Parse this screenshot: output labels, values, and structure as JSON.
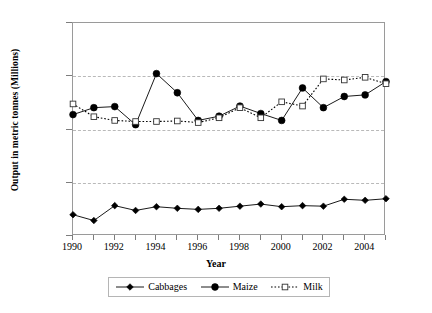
{
  "chart_data": {
    "type": "line",
    "title": "",
    "xlabel": "Year",
    "ylabel": "Output in metric tonnes (Millions)",
    "x": [
      1990,
      1991,
      1992,
      1993,
      1994,
      1995,
      1996,
      1997,
      1998,
      1999,
      2000,
      2001,
      2002,
      2003,
      2004,
      2005
    ],
    "xlim": [
      1990,
      2005
    ],
    "ylim": [
      0.0,
      4.0
    ],
    "ytick_labels": [
      "0.0",
      "1.0",
      "2.0",
      "3.0",
      "4.0"
    ],
    "ytick_values": [
      0.0,
      1.0,
      2.0,
      3.0,
      4.0
    ],
    "xtick_labels": [
      "1990",
      "1992",
      "1994",
      "1996",
      "1998",
      "2000",
      "2002",
      "2004"
    ],
    "xtick_values": [
      1990,
      1992,
      1994,
      1996,
      1998,
      2000,
      2002,
      2004
    ],
    "grid": "horizontal dashed at 1.0, 2.0, 3.0",
    "legend_position": "bottom-center",
    "series": [
      {
        "name": "Cabbages",
        "marker": "filled-diamond",
        "line": "solid",
        "color": "#000000",
        "values": [
          0.4,
          0.29,
          0.57,
          0.48,
          0.55,
          0.52,
          0.5,
          0.52,
          0.56,
          0.6,
          0.55,
          0.57,
          0.56,
          0.69,
          0.67,
          0.7
        ]
      },
      {
        "name": "Maize",
        "marker": "filled-circle",
        "line": "solid",
        "color": "#000000",
        "values": [
          2.28,
          2.41,
          2.43,
          2.09,
          3.05,
          2.69,
          2.17,
          2.25,
          2.44,
          2.3,
          2.17,
          2.78,
          2.41,
          2.62,
          2.65,
          2.9
        ]
      },
      {
        "name": "Milk",
        "marker": "open-square",
        "line": "dotted",
        "color": "#000000",
        "values": [
          2.48,
          2.24,
          2.17,
          2.15,
          2.15,
          2.16,
          2.13,
          2.22,
          2.41,
          2.22,
          2.52,
          2.44,
          2.95,
          2.93,
          2.98,
          2.86
        ]
      }
    ]
  },
  "axis": {
    "y_title": "Output in metric tonnes (Millions)",
    "x_title": "Year"
  },
  "legend": {
    "items": [
      {
        "label": "Cabbages"
      },
      {
        "label": "Maize"
      },
      {
        "label": "Milk"
      }
    ]
  }
}
